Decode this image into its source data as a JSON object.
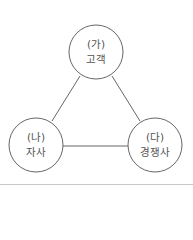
{
  "diagram": {
    "type": "triangle-relationship",
    "nodes": [
      {
        "id": "ga",
        "marker": "(가)",
        "label": "고객"
      },
      {
        "id": "na",
        "marker": "(나)",
        "label": "자사"
      },
      {
        "id": "da",
        "marker": "(다)",
        "label": "경쟁사"
      }
    ],
    "edges": [
      {
        "from": "ga",
        "to": "na"
      },
      {
        "from": "ga",
        "to": "da"
      },
      {
        "from": "na",
        "to": "da"
      }
    ],
    "colors": {
      "stroke": "#666666",
      "text": "#555555",
      "rule": "#c8c8c8"
    }
  }
}
